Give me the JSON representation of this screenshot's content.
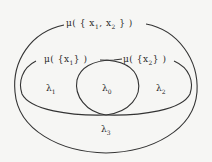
{
  "diagram": {
    "type": "venn-measure-diagram",
    "background": "#f6f6f4",
    "stroke_color": "#333333",
    "sets": [
      {
        "id": "outer",
        "label": "μ( { x1, x2 } )",
        "label_parts": {
          "prefix": "μ( { x",
          "sub1": "1",
          "mid": ", x",
          "sub2": "2",
          "suffix": " } )"
        }
      },
      {
        "id": "left",
        "label": "μ( {x1} )",
        "label_parts": {
          "prefix": "μ( {x",
          "sub": "1",
          "suffix": "} )"
        }
      },
      {
        "id": "right",
        "label": "μ( {x2} )",
        "label_parts": {
          "prefix": "μ( {x",
          "sub": "2",
          "suffix": "} )"
        }
      }
    ],
    "regions": [
      {
        "id": "lambda1",
        "symbol": "λ",
        "sub": "1"
      },
      {
        "id": "lambda0",
        "symbol": "λ",
        "sub": "0"
      },
      {
        "id": "lambda2",
        "symbol": "λ",
        "sub": "2"
      },
      {
        "id": "lambda3",
        "symbol": "λ",
        "sub": "3"
      }
    ]
  }
}
